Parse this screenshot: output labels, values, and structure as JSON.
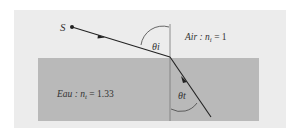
{
  "diagram": {
    "source_label": "S",
    "incident_angle_label": "θi",
    "refracted_angle_label": "θt",
    "air_label": "Air : n",
    "air_sub": "i",
    "air_value": " = 1",
    "water_label": "Eau : n",
    "water_sub": "t",
    "water_value": " = 1.33",
    "colors": {
      "frame_bg": "#ececec",
      "water": "#b9b9b9",
      "line": "#222222",
      "normal": "#777777"
    }
  }
}
